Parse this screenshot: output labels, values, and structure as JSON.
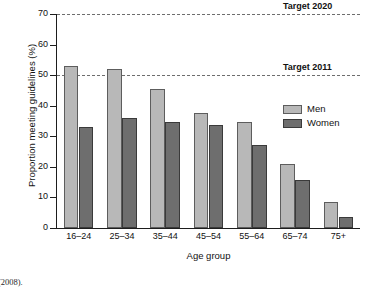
{
  "chart_data": {
    "type": "bar",
    "title": "",
    "xlabel": "Age group",
    "ylabel": "Proportion meeting guidelines (%)",
    "categories": [
      "16–24",
      "25–34",
      "35–44",
      "45–54",
      "55–64",
      "65–74",
      "75+"
    ],
    "series": [
      {
        "name": "Men",
        "color": "#b8b8b8",
        "values": [
          53,
          52,
          45.5,
          37.7,
          34.8,
          20.8,
          8.5
        ]
      },
      {
        "name": "Women",
        "color": "#6e6e6e",
        "values": [
          33,
          36,
          34.7,
          33.7,
          27,
          15.7,
          3.5
        ]
      }
    ],
    "ylim": [
      0,
      70
    ],
    "yticks": [
      0,
      10,
      20,
      30,
      40,
      50,
      60,
      70
    ],
    "ytick_labels": [
      "0",
      "10",
      "20",
      "30",
      "40",
      "50",
      "60",
      "70"
    ],
    "grid": false,
    "legend_position": "right-inside",
    "reference_lines": [
      {
        "label": "Target 2020",
        "value": 70,
        "style": "dashed",
        "color": "#6d6d6d"
      },
      {
        "label": "Target 2011",
        "value": 50,
        "style": "dashed",
        "color": "#6d6d6d"
      }
    ]
  },
  "legend": {
    "items": [
      {
        "label": "Men"
      },
      {
        "label": "Women"
      }
    ]
  },
  "caption": {
    "text": "e (2008)."
  }
}
